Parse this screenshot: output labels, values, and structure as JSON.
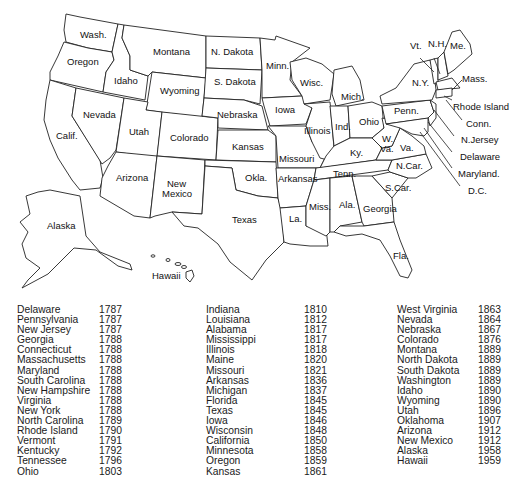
{
  "map": {
    "labels": {
      "wash": "Wash.",
      "oregon": "Oregon",
      "calif": "Calif.",
      "idaho": "Idaho",
      "nevada": "Nevada",
      "montana": "Montana",
      "wyoming": "Wyoming",
      "utah": "Utah",
      "colorado": "Colorado",
      "arizona": "Arizona",
      "new_mexico_1": "New",
      "new_mexico_2": "Mexico",
      "n_dakota": "N. Dakota",
      "s_dakota": "S. Dakota",
      "nebraska": "Nebraska",
      "kansas": "Kansas",
      "okla": "Okla.",
      "texas": "Texas",
      "minn": "Minn.",
      "iowa": "Iowa",
      "missouri": "Missouri",
      "arkansas": "Arkansas",
      "la": "La.",
      "wisc": "Wisc.",
      "illinois": "Illinois",
      "mich": "Mich.",
      "ind": "Ind.",
      "ohio": "Ohio",
      "ky": "Ky.",
      "tenn": "Tenn.",
      "miss": "Miss.",
      "ala": "Ala.",
      "georgia": "Georgia",
      "fla": "Fla.",
      "s_car": "S.Car.",
      "n_car": "N.Car.",
      "va": "Va.",
      "w_va_1": "W.",
      "w_va_2": "Va.",
      "penn": "Penn.",
      "ny": "N.Y.",
      "vt": "Vt.",
      "nh": "N.H.",
      "me": "Me.",
      "mass": "Mass.",
      "rhode_island": "Rhode Island",
      "conn": "Conn.",
      "n_jersey": "N.Jersey",
      "delaware": "Delaware",
      "maryland": "Maryland.",
      "dc": "D.C.",
      "alaska": "Alaska",
      "hawaii": "Hawaii"
    }
  },
  "statehood_table": {
    "columns": [
      [
        {
          "state": "Delaware",
          "year": "1787"
        },
        {
          "state": "Pennsylvania",
          "year": "1787"
        },
        {
          "state": "New Jersey",
          "year": "1787"
        },
        {
          "state": "Georgia",
          "year": "1788"
        },
        {
          "state": "Connecticut",
          "year": "1788"
        },
        {
          "state": "Massachusetts",
          "year": "1788"
        },
        {
          "state": "Maryland",
          "year": "1788"
        },
        {
          "state": "South Carolina",
          "year": "1788"
        },
        {
          "state": "New Hampshire",
          "year": "1788"
        },
        {
          "state": "Virginia",
          "year": "1788"
        },
        {
          "state": "New York",
          "year": "1788"
        },
        {
          "state": "North Carolina",
          "year": "1789"
        },
        {
          "state": "Rhode Island",
          "year": "1790"
        },
        {
          "state": "Vermont",
          "year": "1791"
        },
        {
          "state": "Kentucky",
          "year": "1792"
        },
        {
          "state": "Tennessee",
          "year": "1796"
        },
        {
          "state": "Ohio",
          "year": "1803"
        }
      ],
      [
        {
          "state": "Indiana",
          "year": "1810"
        },
        {
          "state": "Louisiana",
          "year": "1812"
        },
        {
          "state": "Alabama",
          "year": "1817"
        },
        {
          "state": "Mississippi",
          "year": "1817"
        },
        {
          "state": "Illinois",
          "year": "1818"
        },
        {
          "state": "Maine",
          "year": "1820"
        },
        {
          "state": "Missouri",
          "year": "1821"
        },
        {
          "state": "Arkansas",
          "year": "1836"
        },
        {
          "state": "Michigan",
          "year": "1837"
        },
        {
          "state": "Florida",
          "year": "1845"
        },
        {
          "state": "Texas",
          "year": "1845"
        },
        {
          "state": "Iowa",
          "year": "1846"
        },
        {
          "state": "Wisconsin",
          "year": "1848"
        },
        {
          "state": "California",
          "year": "1850"
        },
        {
          "state": "Minnesota",
          "year": "1858"
        },
        {
          "state": "Oregon",
          "year": "1859"
        },
        {
          "state": "Kansas",
          "year": "1861"
        }
      ],
      [
        {
          "state": "West Virginia",
          "year": "1863"
        },
        {
          "state": "Nevada",
          "year": "1864"
        },
        {
          "state": "Nebraska",
          "year": "1867"
        },
        {
          "state": "Colorado",
          "year": "1876"
        },
        {
          "state": "Montana",
          "year": "1889"
        },
        {
          "state": "North Dakota",
          "year": "1889"
        },
        {
          "state": "South Dakota",
          "year": "1889"
        },
        {
          "state": "Washington",
          "year": "1889"
        },
        {
          "state": "Idaho",
          "year": "1890"
        },
        {
          "state": "Wyoming",
          "year": "1890"
        },
        {
          "state": "Utah",
          "year": "1896"
        },
        {
          "state": "Oklahoma",
          "year": "1907"
        },
        {
          "state": "Arizona",
          "year": "1912"
        },
        {
          "state": "New Mexico",
          "year": "1912"
        },
        {
          "state": "Alaska",
          "year": "1958"
        },
        {
          "state": "Hawaii",
          "year": "1959"
        }
      ]
    ]
  }
}
